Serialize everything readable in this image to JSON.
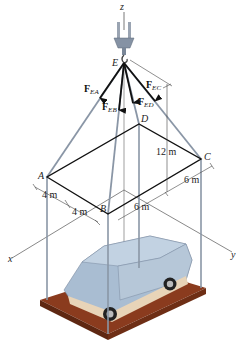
{
  "figure": {
    "points": {
      "E": {
        "label": "E"
      },
      "A": {
        "label": "A"
      },
      "B": {
        "label": "B"
      },
      "C": {
        "label": "C"
      },
      "D": {
        "label": "D"
      }
    },
    "axes": {
      "x": "x",
      "y": "y",
      "z": "z"
    },
    "forces": [
      {
        "name": "F",
        "sub": "EA"
      },
      {
        "name": "F",
        "sub": "EB"
      },
      {
        "name": "F",
        "sub": "ED"
      },
      {
        "name": "F",
        "sub": "EC"
      }
    ],
    "dimensions": {
      "height": "12 m",
      "ab_part1": "4 m",
      "ab_part2": "4 m",
      "bc_part1": "6 m",
      "bc_part2": "6 m"
    },
    "colors": {
      "cable": "#8a96a6",
      "frame": "#111111",
      "platform": "#8a3b1e",
      "car_body": "#a9bdd2",
      "car_trim": "#e8d4b8"
    }
  }
}
